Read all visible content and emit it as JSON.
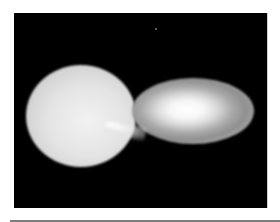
{
  "image": {
    "subject": "binary star system with mass transfer onto accretion disk",
    "background_color": "#000000",
    "frame_border_color": "#cfcfcf",
    "page_background": "#ffffff",
    "bottom_rule_color": "#7d7d7d",
    "elements": [
      {
        "name": "donor-star",
        "shape": "teardrop",
        "color": "#e4e4e4"
      },
      {
        "name": "mass-transfer-stream",
        "color": "#ffffff"
      },
      {
        "name": "accretion-disk",
        "shape": "ellipse",
        "core_color": "#ffffff",
        "edge_color": "#8a8a8a"
      },
      {
        "name": "background-star",
        "color": "#777777"
      }
    ]
  }
}
